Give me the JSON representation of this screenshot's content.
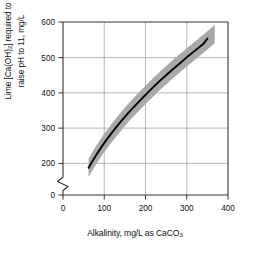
{
  "chart_data": {
    "type": "line",
    "title": "",
    "xlabel": "Alkalinity, mg/L as CaCO3",
    "xlabel_parts": {
      "main": "Alkalinity, mg/L as CaCO",
      "sub": "3"
    },
    "ylabel": "Lime [Ca(OH)2] required to raise pH to 11, mg/L",
    "ylabel_line1_parts": {
      "a": "Lime [Ca(OH)",
      "sub": "2",
      "b": "] required to"
    },
    "ylabel_line2": "raise pH to 11, mg/L",
    "xlim": [
      0,
      400
    ],
    "ylim": [
      0,
      600
    ],
    "y_axis_break": true,
    "y_break_between": [
      0,
      200
    ],
    "xticks": [
      0,
      100,
      200,
      300,
      400
    ],
    "xticklabels": [
      "0",
      "100",
      "200",
      "300",
      "400"
    ],
    "yticks": [
      0,
      200,
      300,
      400,
      500,
      600
    ],
    "yticklabels": [
      "0",
      "200",
      "300",
      "400",
      "500",
      "600"
    ],
    "grid": "both",
    "legend": "none",
    "series": [
      {
        "name": "Lime dose curve",
        "style": "solid-black-line",
        "color": "#000000",
        "x": [
          62,
          80,
          100,
          120,
          140,
          160,
          180,
          200,
          220,
          240,
          260,
          280,
          300,
          320,
          340,
          350
        ],
        "values": [
          188,
          223,
          258,
          289,
          318,
          345,
          370,
          394,
          417,
          439,
          460,
          480,
          500,
          519,
          538,
          553
        ]
      },
      {
        "name": "Uncertainty band",
        "style": "shaded-gray-band",
        "color": "#a9a9a9",
        "band_half_width": 26,
        "x": [
          62,
          80,
          100,
          120,
          140,
          160,
          180,
          200,
          220,
          240,
          260,
          280,
          300,
          320,
          340,
          350,
          368
        ],
        "upper": [
          214,
          249,
          284,
          315,
          344,
          371,
          396,
          420,
          443,
          465,
          486,
          506,
          526,
          545,
          564,
          574,
          592
        ],
        "lower": [
          162,
          197,
          232,
          263,
          292,
          319,
          344,
          368,
          391,
          413,
          434,
          454,
          474,
          493,
          512,
          522,
          540
        ]
      }
    ]
  }
}
